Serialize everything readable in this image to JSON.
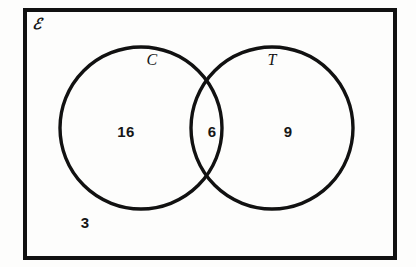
{
  "figure": {
    "type": "venn-diagram",
    "universe_label": "ℰ",
    "universe_label_plain": "E",
    "background_color": "#fdfdfc",
    "stroke_color": "#111111",
    "text_color": "#151515",
    "border": {
      "label": "universal-set-rectangle",
      "x": 25,
      "y": 10,
      "width": 370,
      "height": 248,
      "stroke_width": 4
    },
    "sets": [
      {
        "id": "C",
        "label": "C",
        "cx": 141,
        "cy": 128,
        "r": 81,
        "label_x": 152,
        "label_y": 60
      },
      {
        "id": "T",
        "label": "T",
        "cx": 272,
        "cy": 128,
        "r": 81,
        "label_x": 272,
        "label_y": 60
      }
    ],
    "regions": [
      {
        "id": "C-only",
        "name": "C-only-count",
        "value": "16",
        "x": 126,
        "y": 131
      },
      {
        "id": "C-and-T",
        "name": "intersection-count",
        "value": "6",
        "x": 212,
        "y": 131
      },
      {
        "id": "T-only",
        "name": "T-only-count",
        "value": "9",
        "x": 288,
        "y": 131
      },
      {
        "id": "outside",
        "name": "outside-count",
        "value": "3",
        "x": 85,
        "y": 222
      }
    ]
  },
  "chart_data": {
    "type": "venn",
    "title": "",
    "universe_label": "ℰ",
    "set_labels": [
      "C",
      "T"
    ],
    "region_values": {
      "C_only": 16,
      "C_and_T": 6,
      "T_only": 9,
      "neither": 3
    },
    "totals": {
      "C": 22,
      "T": 15,
      "universe": 34
    }
  }
}
